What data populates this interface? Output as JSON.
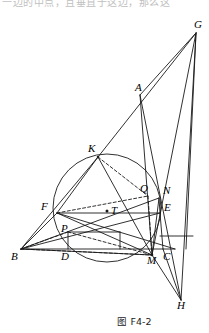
{
  "page": {
    "cut_header_text": "一边的中点，且垂直于这边，那么这",
    "caption": "图 F4-2",
    "background_color": "#ffffff",
    "stroke_color": "#1a1a1a"
  },
  "figure": {
    "type": "geometry-diagram",
    "labels": [
      {
        "name": "G",
        "x": 196,
        "y": 25
      },
      {
        "name": "A",
        "x": 137,
        "y": 88
      },
      {
        "name": "K",
        "x": 90,
        "y": 148
      },
      {
        "name": "Q",
        "x": 142,
        "y": 188
      },
      {
        "name": "N",
        "x": 166,
        "y": 190
      },
      {
        "name": "F",
        "x": 44,
        "y": 206
      },
      {
        "name": "E",
        "x": 166,
        "y": 206
      },
      {
        "name": "T",
        "x": 112,
        "y": 206
      },
      {
        "name": "P",
        "x": 63,
        "y": 225
      },
      {
        "name": "B",
        "x": 13,
        "y": 257
      },
      {
        "name": "D",
        "x": 63,
        "y": 257
      },
      {
        "name": "M",
        "x": 150,
        "y": 261
      },
      {
        "name": "C",
        "x": 166,
        "y": 257
      },
      {
        "name": "H",
        "x": 180,
        "y": 309
      }
    ],
    "points": {
      "G": [
        196,
        33
      ],
      "A": [
        140,
        95
      ],
      "K": [
        98,
        157
      ],
      "Q": [
        148,
        196
      ],
      "N": [
        159,
        198
      ],
      "F": [
        57,
        213
      ],
      "E": [
        160,
        213
      ],
      "T": [
        107,
        211
      ],
      "P": [
        68,
        232
      ],
      "B": [
        21,
        249
      ],
      "D": [
        68,
        249
      ],
      "M": [
        152,
        255
      ],
      "C": [
        163,
        249
      ],
      "H": [
        181,
        300
      ]
    },
    "circle": {
      "cx": 107,
      "cy": 208,
      "r": 54
    },
    "dot_points": [
      "T"
    ],
    "solid_segments": [
      [
        "B",
        "C"
      ],
      [
        "B",
        "F"
      ],
      [
        "B",
        "E"
      ],
      [
        "B",
        "M"
      ],
      [
        "B",
        "N"
      ],
      [
        "F",
        "E"
      ],
      [
        "F",
        "M"
      ],
      [
        "F",
        "C"
      ],
      [
        "F",
        "K"
      ],
      [
        "K",
        "M"
      ],
      [
        "K",
        "B"
      ],
      [
        "K",
        "G"
      ],
      [
        "G",
        "A"
      ],
      [
        "G",
        "M"
      ],
      [
        "G",
        "H"
      ],
      [
        "A",
        "M"
      ],
      [
        "A",
        "H"
      ],
      [
        "M",
        "H"
      ],
      [
        "M",
        "C"
      ],
      [
        "M",
        "N"
      ],
      [
        "N",
        "E"
      ],
      [
        "E",
        "C"
      ],
      [
        "D",
        "P"
      ],
      [
        "P",
        "F"
      ],
      [
        "D",
        "B"
      ],
      [
        "C",
        "H"
      ]
    ],
    "dashed_segments": [
      [
        "K",
        "Q"
      ],
      [
        "Q",
        "M"
      ],
      [
        "B",
        "P"
      ],
      [
        "P",
        "M"
      ],
      [
        "F",
        "Q"
      ],
      [
        "B",
        "Q"
      ]
    ]
  }
}
